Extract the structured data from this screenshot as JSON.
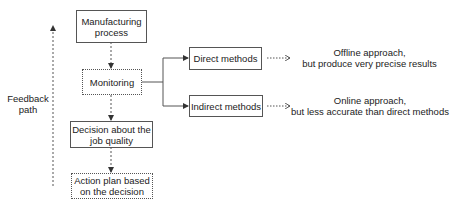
{
  "diagram": {
    "nodes": {
      "manufacturing": {
        "line1": "Manufacturing",
        "line2": "process"
      },
      "monitoring": {
        "label": "Monitoring"
      },
      "decision": {
        "line1": "Decision about the",
        "line2": "job quality"
      },
      "action": {
        "line1": "Action plan based",
        "line2": "on the decision"
      },
      "direct": {
        "label": "Direct methods"
      },
      "indirect": {
        "label": "Indirect methods"
      }
    },
    "notes": {
      "direct": {
        "line1": "Offline approach,",
        "line2": "but produce very precise results"
      },
      "indirect": {
        "line1": "Online approach,",
        "line2": "but less accurate than direct methods"
      }
    },
    "feedback": {
      "line1": "Feedback",
      "line2": "path"
    },
    "colors": {
      "stroke": "#555555",
      "text": "#222222"
    }
  }
}
